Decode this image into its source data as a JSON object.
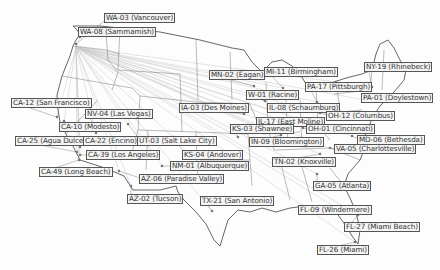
{
  "map": {
    "title": "US Congressional District Locations",
    "colors": {
      "border": "#555555",
      "land": "#ffffff",
      "line": "#bbbbbb",
      "dot": "#777777",
      "label_bg": "#f4f4f4"
    },
    "origin": {
      "x": 76,
      "y": 47
    },
    "markers": [
      {
        "label": "WA-03 (Vancouver)",
        "lx": 104,
        "ly": 13,
        "px": 76,
        "py": 44
      },
      {
        "label": "WA-08 (Sammamish)",
        "lx": 78,
        "ly": 27,
        "px": 80,
        "py": 37
      },
      {
        "label": "CA-12 (San Francisco)",
        "lx": 11,
        "ly": 98,
        "px": 57,
        "py": 117
      },
      {
        "label": "NV-04 (Las Vegas)",
        "lx": 85,
        "ly": 109,
        "px": 96,
        "py": 133
      },
      {
        "label": "CA-10 (Modesto)",
        "lx": 59,
        "ly": 122,
        "px": 64,
        "py": 121
      },
      {
        "label": "CA-25 (Agua Dulce)",
        "lx": 15,
        "ly": 136,
        "px": 77,
        "py": 152
      },
      {
        "label": "CA-22 (Encino)",
        "lx": 83,
        "ly": 136,
        "px": 80,
        "py": 147
      },
      {
        "label": "UT-03 (Salt Lake City)",
        "lx": 137,
        "ly": 136,
        "px": 128,
        "py": 124
      },
      {
        "label": "CA-39 (Los Angeles)",
        "lx": 86,
        "ly": 150,
        "px": 80,
        "py": 155
      },
      {
        "label": "CA-49 (Long Beach)",
        "lx": 39,
        "ly": 167,
        "px": 79,
        "py": 160
      },
      {
        "label": "KS-04 (Andover)",
        "lx": 182,
        "ly": 150,
        "px": 173,
        "py": 137
      },
      {
        "label": "NM-01 (Albuquerque)",
        "lx": 170,
        "ly": 161,
        "px": 162,
        "py": 166
      },
      {
        "label": "AZ-06 (Paradise Valley)",
        "lx": 139,
        "ly": 174,
        "px": 119,
        "py": 171
      },
      {
        "label": "AZ-02 (Tucson)",
        "lx": 127,
        "ly": 194,
        "px": 131,
        "py": 186
      },
      {
        "label": "TX-21 (San Antonio)",
        "lx": 200,
        "ly": 196,
        "px": 212,
        "py": 211
      },
      {
        "label": "MN-02 (Eagan)",
        "lx": 209,
        "ly": 70,
        "px": 254,
        "py": 86
      },
      {
        "label": "MI-11 (Birmingham)",
        "lx": 264,
        "ly": 67,
        "px": 283,
        "py": 88
      },
      {
        "label": "W-01 (Racine)",
        "lx": 246,
        "ly": 90,
        "px": 265,
        "py": 101
      },
      {
        "label": "IA-03 (Des Moines)",
        "lx": 179,
        "ly": 103,
        "px": 244,
        "py": 114
      },
      {
        "label": "IL-08 (Schaumburg)",
        "lx": 267,
        "ly": 103,
        "px": 270,
        "py": 110
      },
      {
        "label": "IL-17 (East Moline)",
        "lx": 256,
        "ly": 117,
        "px": 253,
        "py": 126
      },
      {
        "label": "KS-03 (Shawnee)",
        "lx": 230,
        "ly": 124,
        "px": 238,
        "py": 137
      },
      {
        "label": "OH-01 (Cincinnati)",
        "lx": 306,
        "ly": 124,
        "px": 303,
        "py": 128
      },
      {
        "label": "IN-09 (Bloomington)",
        "lx": 249,
        "ly": 137,
        "px": 281,
        "py": 135
      },
      {
        "label": "PA-17 (Pittsburgh)",
        "lx": 305,
        "ly": 82,
        "px": 317,
        "py": 102
      },
      {
        "label": "NY-19 (Rhinebeck)",
        "lx": 364,
        "ly": 62,
        "px": 372,
        "py": 87
      },
      {
        "label": "PA-01 (Doylestown)",
        "lx": 361,
        "ly": 93,
        "px": 365,
        "py": 100
      },
      {
        "label": "OH-12 (Columbus)",
        "lx": 326,
        "ly": 111,
        "px": 320,
        "py": 113
      },
      {
        "label": "MD-06 (Bethesda)",
        "lx": 357,
        "ly": 135,
        "px": 352,
        "py": 136
      },
      {
        "label": "VA-05 (Charlottesville)",
        "lx": 334,
        "ly": 144,
        "px": 330,
        "py": 148
      },
      {
        "label": "TN-02 (Knoxville)",
        "lx": 272,
        "ly": 157,
        "px": 320,
        "py": 154
      },
      {
        "label": "GA-05 (Atlanta)",
        "lx": 313,
        "ly": 181,
        "px": 317,
        "py": 174
      },
      {
        "label": "FL-09 (Windermere)",
        "lx": 298,
        "ly": 205,
        "px": 338,
        "py": 209
      },
      {
        "label": "FL-27 (Miami Beach)",
        "lx": 344,
        "ly": 222,
        "px": 358,
        "py": 215
      },
      {
        "label": "FL-26 (Miami)",
        "lx": 317,
        "ly": 245,
        "px": 355,
        "py": 242
      }
    ]
  }
}
